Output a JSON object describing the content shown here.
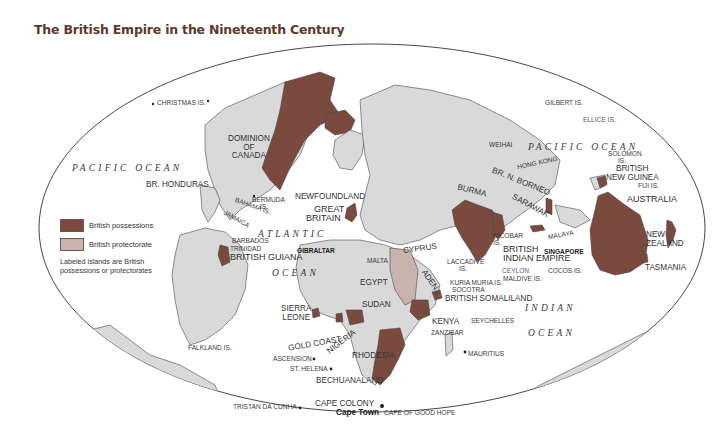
{
  "title": "The British Empire in the Nineteenth Century",
  "colors": {
    "possession": "#7a4a3e",
    "protectorate": "#c9b3ad",
    "land": "#d9d9d9",
    "ocean": "#ffffff",
    "coast": "#4a4a4a",
    "title": "#5a3a2e"
  },
  "legend": {
    "items": [
      {
        "label": "British possessions",
        "type": "possession"
      },
      {
        "label": "British protectorate",
        "type": "protectorate"
      }
    ],
    "note": "Labeled islands are British possessions or protectorates"
  },
  "oceans": {
    "pacific_west": "PACIFIC OCEAN",
    "pacific_east": "PACIFIC OCEAN",
    "atlantic": "ATLANTIC",
    "atlantic_ocean": "OCEAN",
    "indian": "INDIAN",
    "indian_ocean": "OCEAN"
  },
  "labels": {
    "christmas": "CHRISTMAS IS.",
    "canada": "DOMINION OF CANADA",
    "canada_l1": "DOMINION",
    "canada_l2": "OF",
    "canada_l3": "CANADA",
    "br_honduras": "BR. HONDURAS",
    "bermuda_l1": "BERMUDA",
    "bermuda_l2": "IS.",
    "bahama": "BAHAMA IS.",
    "jamaica": "JAMAICA",
    "newfoundland": "NEWFOUNDLAND",
    "great_britain_l1": "GREAT",
    "great_britain_l2": "BRITAIN",
    "barbados": "BARBADOS",
    "trinidad": "TRINIDAD",
    "british_guiana": "BRITISH GUIANA",
    "gibraltar": "GIBRALTAR",
    "malta": "MALTA",
    "cyprus": "CYPRUS",
    "egypt": "EGYPT",
    "sudan": "SUDAN",
    "aden": "ADEN",
    "sierra_leone_l1": "SIERRA",
    "sierra_leone_l2": "LEONE",
    "gold_coast": "GOLD COAST",
    "nigeria": "NIGERIA",
    "rhodesia": "RHODESIA",
    "kenya": "KENYA",
    "zanzibar": "ZANZIBAR",
    "bechuanaland": "BECHUANALAND",
    "cape_colony": "CAPE COLONY",
    "cape_town": "Cape Town",
    "cape_good_hope": "CAPE OF GOOD HOPE",
    "ascension": "ASCENSION",
    "st_helena": "ST. HELENA",
    "tristan": "TRISTAN DA CUNHA",
    "falkland": "FALKLAND IS.",
    "laccadive_l1": "LACCADIVE",
    "laccadive_l2": "IS.",
    "kuria_muria": "KURIA MURIA IS.",
    "socotra": "SOCOTRA",
    "british_somaliland": "BRITISH SOMALILAND",
    "seychelles": "SEYCHELLES",
    "mauritius": "MAURITIUS",
    "ceylon": "CEYLON",
    "maldive": "MALDIVE IS.",
    "cocos": "COCOS IS.",
    "burma": "BURMA",
    "weihai": "WEIHAI",
    "hong_kong": "HONG KONG",
    "br_n_borneo": "BR. N. BORNEO",
    "sarawak": "SARAWAK",
    "nicobar_l1": "NICOBAR",
    "nicobar_l2": "IS.",
    "malaya": "MALAYA",
    "singapore": "SINGAPORE",
    "british_indian_l1": "BRITISH",
    "british_indian_l2": "INDIAN EMPIRE",
    "gilbert": "GILBERT IS.",
    "ellice": "ELLICE IS.",
    "solomon_l1": "SOLOMON",
    "solomon_l2": "IS.",
    "british_ng_l1": "BRITISH",
    "british_ng_l2": "NEW GUINEA",
    "fiji": "FIJI IS.",
    "australia": "AUSTRALIA",
    "new_zealand_l1": "NEW",
    "new_zealand_l2": "ZEALAND",
    "tasmania": "TASMANIA"
  }
}
